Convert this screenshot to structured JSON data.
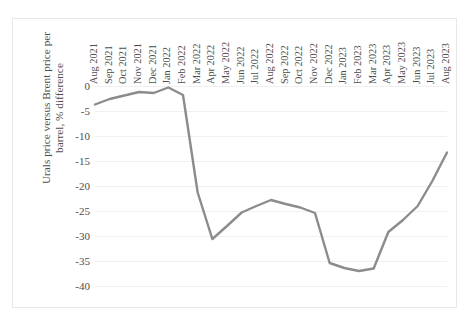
{
  "chart_data": {
    "type": "line",
    "title": "",
    "xlabel": "",
    "ylabel": "Urals price versus Brent price per barrel, % difference",
    "ylabel_line1": "Urals price versus Brent price per",
    "ylabel_line2": "barrel, % difference",
    "ylim": [
      -40,
      0
    ],
    "yticks": [
      0,
      -5,
      -10,
      -15,
      -20,
      -25,
      -30,
      -35,
      -40
    ],
    "ytick_labels": [
      "0",
      "-5",
      "-10",
      "-15",
      "-20",
      "-25",
      "-30",
      "-35",
      "-40"
    ],
    "grid": true,
    "legend": "none",
    "line_color": "#8c8c8c",
    "gridline_color": "#f0f0f0",
    "background_color": "#ffffff",
    "border_color": "#e8e8e8",
    "categories": [
      "Aug 2021",
      "Sep 2021",
      "Oct 2021",
      "Nov 2021",
      "Dec 2021",
      "Jan 2022",
      "Feb 2022",
      "Mar 2022",
      "Apr 2022",
      "May 2022",
      "Jun 2022",
      "Jul 2022",
      "Aug 2022",
      "Sep 2022",
      "Oct 2022",
      "Nov 2022",
      "Dec 2022",
      "Jan 2023",
      "Feb 2023",
      "Mar 2023",
      "Apr 2023",
      "May 2023",
      "Jun 2023",
      "Jul 2023",
      "Aug 2023"
    ],
    "values": [
      -3.7,
      -2.6,
      -1.9,
      -1.2,
      -1.4,
      -0.3,
      -1.8,
      -21.3,
      -30.6,
      -28.0,
      -25.3,
      -24.0,
      -22.8,
      -23.6,
      -24.3,
      -25.4,
      -35.4,
      -36.4,
      -37.0,
      -36.5,
      -29.2,
      -26.8,
      -24.0,
      -19.0,
      -13.3
    ]
  }
}
